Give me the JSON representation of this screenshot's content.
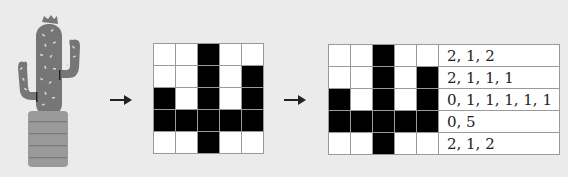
{
  "diagram": {
    "steps": [
      {
        "id": "image",
        "description": "cactus-in-pot illustration"
      },
      {
        "id": "bitmap",
        "description": "5x5 black/white pixel grid"
      },
      {
        "id": "encoding",
        "description": "5x5 grid with run-length codes per row"
      }
    ],
    "colors": {
      "background": "#ebebeb",
      "cactus": "#767676",
      "pot": "#9a9a9a",
      "pixel_on": "#000000",
      "pixel_off": "#ffffff",
      "grid_line": "#9a9a9a"
    },
    "grid": [
      [
        0,
        0,
        1,
        0,
        0
      ],
      [
        0,
        0,
        1,
        0,
        1
      ],
      [
        1,
        0,
        1,
        0,
        1
      ],
      [
        1,
        1,
        1,
        1,
        1
      ],
      [
        0,
        0,
        1,
        0,
        0
      ]
    ],
    "row_codes": [
      "2, 1, 2",
      "2, 1, 1, 1",
      "0, 1, 1, 1, 1, 1",
      "0, 5",
      "2, 1, 2"
    ],
    "arrows": [
      "arrow-1",
      "arrow-2"
    ]
  }
}
